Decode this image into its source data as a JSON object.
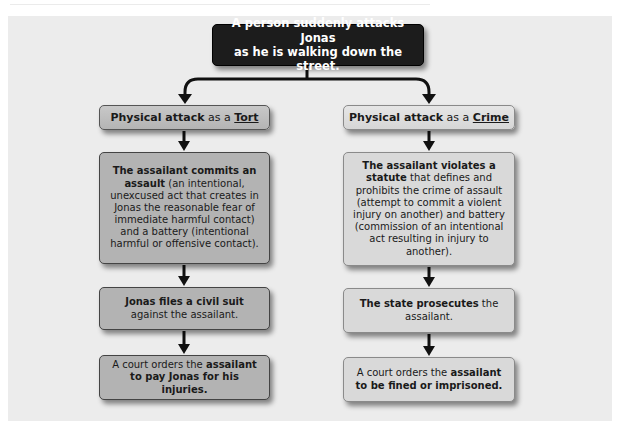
{
  "diagram": {
    "type": "flowchart",
    "top": {
      "text_line1": "A person suddenly attacks Jonas",
      "text_line2": "as he is walking down the street."
    },
    "left_branch": {
      "header": {
        "bold": "Physical attack",
        "plain": " as a ",
        "underlined": "Tort"
      },
      "steps": [
        {
          "bold": "The assailant commits an assault",
          "plain": " (an intentional, unexcused act that creates in Jonas the reasonable fear of immediate harmful contact) and a battery (intentional harmful or offensive contact)."
        },
        {
          "bold": "Jonas files a civil suit",
          "plain": " against the assailant."
        },
        {
          "plain": "A court orders the ",
          "bold": "assailant to pay Jonas for his injuries."
        }
      ]
    },
    "right_branch": {
      "header": {
        "bold": "Physical attack",
        "plain": " as a ",
        "underlined": "Crime"
      },
      "steps": [
        {
          "bold": "The assailant violates a statute",
          "plain": " that defines and prohibits the crime of assault (attempt to commit a violent injury on another) and battery (commission of an intentional act resulting in injury to another)."
        },
        {
          "bold": "The state prosecutes",
          "plain": " the assailant."
        },
        {
          "plain": "A court orders the ",
          "bold": "assailant to be fined or imprisoned."
        }
      ]
    },
    "colors": {
      "panel_bg": "#ececec",
      "top_box_bg": "#1c1c1c",
      "left_box_bg": "#b3b3b3",
      "right_box_bg": "#d9d9d9",
      "arrow": "#111111"
    }
  }
}
